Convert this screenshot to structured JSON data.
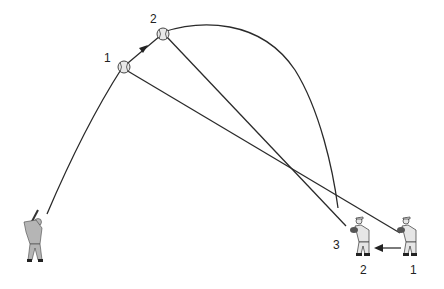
{
  "diagram": {
    "ball_labels": [
      "1",
      "2"
    ],
    "sightline_end_label": "3",
    "fielder_labels": [
      "2",
      "1"
    ],
    "colors": {
      "line": "#2a2a2a",
      "background": "#ffffff",
      "figure_gray": "#b5b5b5"
    },
    "elements": {
      "batter": "batter-figure",
      "fielder_start": "fielder-position-1",
      "fielder_end": "fielder-position-2",
      "motion_arrow": "left-arrow"
    }
  }
}
